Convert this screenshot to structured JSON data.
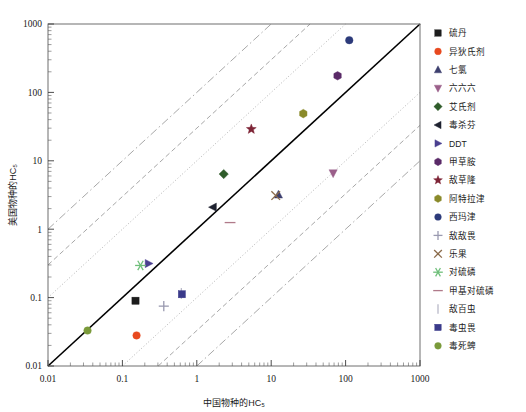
{
  "chart_data": {
    "type": "scatter",
    "title": "",
    "xlabel": "中国物种的HC₅",
    "ylabel": "美国物种的HC₅",
    "xscale": "log",
    "yscale": "log",
    "xlim": [
      0.01,
      1000
    ],
    "ylim": [
      0.01,
      1000
    ],
    "grid": false,
    "legend_position": "right",
    "xticks": [
      "0.01",
      "0.1",
      "1",
      "10",
      "100",
      "1000"
    ],
    "yticks": [
      "0.01",
      "0.1",
      "1",
      "10",
      "100",
      "1000"
    ],
    "xtick_values": [
      0.01,
      0.1,
      1,
      10,
      100,
      1000
    ],
    "ytick_values": [
      0.01,
      0.1,
      1,
      10,
      100,
      1000
    ],
    "reference_lines": [
      {
        "name": "1:1",
        "ratio": 1,
        "style": "solid",
        "color": "#000000"
      },
      {
        "name": "1:10",
        "ratio": 0.1,
        "style": "dotted",
        "color": "#9a9a9a"
      },
      {
        "name": "10:1",
        "ratio": 10,
        "style": "dotted",
        "color": "#9a9a9a"
      },
      {
        "name": "1:30",
        "ratio": 0.033,
        "style": "dashed",
        "color": "#8a8a8a"
      },
      {
        "name": "30:1",
        "ratio": 30,
        "style": "dashed",
        "color": "#8a8a8a"
      },
      {
        "name": "1:100",
        "ratio": 0.01,
        "style": "dashdot",
        "color": "#8a8a8a"
      },
      {
        "name": "100:1",
        "ratio": 100,
        "style": "dashdot",
        "color": "#8a8a8a"
      }
    ],
    "series": [
      {
        "name": "硫丹",
        "marker": "square",
        "color": "#1c1c1c",
        "x": 0.15,
        "y": 0.09
      },
      {
        "name": "异狄氏剂",
        "marker": "circle",
        "color": "#e8491f",
        "x": 0.155,
        "y": 0.028
      },
      {
        "name": "七氯",
        "marker": "triangle-up",
        "color": "#3d3f6e",
        "x": 12.5,
        "y": 3.2
      },
      {
        "name": "六六六",
        "marker": "triangle-down",
        "color": "#9b5f8a",
        "x": 68.0,
        "y": 6.6
      },
      {
        "name": "艾氏剂",
        "marker": "diamond",
        "color": "#2f5c2a",
        "x": 2.3,
        "y": 6.4
      },
      {
        "name": "毒杀芬",
        "marker": "triangle-left",
        "color": "#1e2230",
        "x": 1.65,
        "y": 2.1
      },
      {
        "name": "DDT",
        "marker": "triangle-right",
        "color": "#4a3f8f",
        "x": 0.225,
        "y": 0.315
      },
      {
        "name": "甲草胺",
        "marker": "hexagon",
        "color": "#5a2a68",
        "x": 78.0,
        "y": 175.0
      },
      {
        "name": "敌草隆",
        "marker": "star",
        "color": "#7d2436",
        "x": 5.4,
        "y": 29.0
      },
      {
        "name": "阿特拉津",
        "marker": "hexagon",
        "color": "#8a8a2a",
        "x": 27.0,
        "y": 49.0
      },
      {
        "name": "西玛津",
        "marker": "circle",
        "color": "#2c3a7a",
        "x": 112.0,
        "y": 580.0
      },
      {
        "name": "敌敌畏",
        "marker": "plus",
        "color": "#9a9ab0",
        "x": 0.36,
        "y": 0.075
      },
      {
        "name": "乐果",
        "marker": "cross",
        "color": "#8a6a4a",
        "x": 11.5,
        "y": 3.1
      },
      {
        "name": "对硫磷",
        "marker": "asterisk",
        "color": "#6fbf7a",
        "x": 0.175,
        "y": 0.295
      },
      {
        "name": "甲基对硫磷",
        "marker": "hline",
        "color": "#b07a8a",
        "x": 2.8,
        "y": 1.25
      },
      {
        "name": "敌百虫",
        "marker": "vline",
        "color": "#b8b8c8",
        "x": 0.62,
        "y": 0.115
      },
      {
        "name": "毒虫畏",
        "marker": "square",
        "color": "#3a3a8a",
        "x": 0.63,
        "y": 0.112
      },
      {
        "name": "毒死蜱",
        "marker": "circle",
        "color": "#7a9a3a",
        "x": 0.034,
        "y": 0.033
      }
    ]
  },
  "legend": {
    "items": [
      {
        "label": "硫丹"
      },
      {
        "label": "异狄氏剂"
      },
      {
        "label": "七氯"
      },
      {
        "label": "六六六"
      },
      {
        "label": "艾氏剂"
      },
      {
        "label": "毒杀芬"
      },
      {
        "label": "DDT"
      },
      {
        "label": "甲草胺"
      },
      {
        "label": "敌草隆"
      },
      {
        "label": "阿特拉津"
      },
      {
        "label": "西玛津"
      },
      {
        "label": "敌敌畏"
      },
      {
        "label": "乐果"
      },
      {
        "label": "对硫磷"
      },
      {
        "label": "甲基对硫磷"
      },
      {
        "label": "敌百虫"
      },
      {
        "label": "毒虫畏"
      },
      {
        "label": "毒死蜱"
      }
    ]
  }
}
